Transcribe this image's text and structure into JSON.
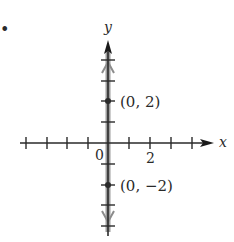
{
  "figure": {
    "bullet": "•",
    "axes": {
      "x_label": "x",
      "y_label": "y",
      "origin_label": "0",
      "x_tick_label": "2",
      "x_range": [
        -4,
        4
      ],
      "y_range": [
        -4,
        4
      ],
      "tick_spacing": 1
    },
    "points": [
      {
        "label": "(0, 2)",
        "x": 0,
        "y": 2
      },
      {
        "label": "(0, −2)",
        "x": 0,
        "y": -2
      }
    ],
    "graph_description": "Vertical line x = 0 (the y-axis) highlighted in gray with arrows both directions",
    "colors": {
      "axis": "#2a2a2a",
      "highlight": "#8c8c8c",
      "text": "#2a2a2a"
    }
  }
}
